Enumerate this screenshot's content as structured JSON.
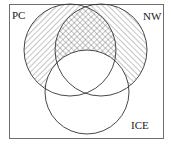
{
  "diagram": {
    "type": "venn",
    "universe_border_color": "#6e6e6e",
    "stroke_color": "#333333",
    "sets": [
      {
        "id": "pc",
        "label": "PC",
        "cx": 70,
        "cy": 50,
        "r": 46
      },
      {
        "id": "nw",
        "label": "NW",
        "cx": 101,
        "cy": 50,
        "r": 46
      },
      {
        "id": "ice",
        "label": "ICE",
        "cx": 87,
        "cy": 92,
        "r": 42
      }
    ],
    "shaded_regions": [
      {
        "region": "PC only",
        "pattern": "diagonal-backslash"
      },
      {
        "region": "NW only",
        "pattern": "diagonal-forward-slash"
      },
      {
        "region": "PC and NW, not ICE",
        "pattern": "cross-hatch"
      }
    ],
    "unshaded_regions": [
      "ICE (all parts)",
      "outside all sets"
    ]
  }
}
